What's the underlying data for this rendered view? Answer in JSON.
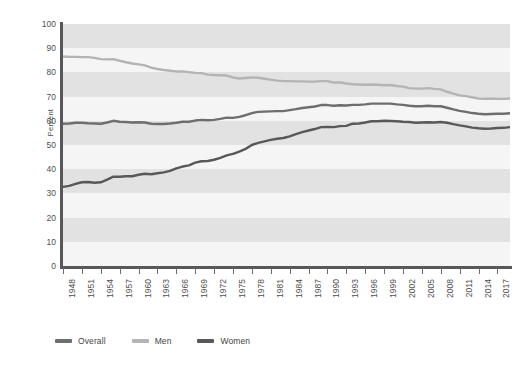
{
  "chart_data": {
    "type": "line",
    "title": "",
    "xlabel": "",
    "ylabel": "Percent",
    "ylim": [
      0,
      100
    ],
    "ytick_step": 10,
    "ytick_labels": [
      "100",
      "90",
      "80",
      "70",
      "60",
      "50",
      "40",
      "30",
      "20",
      "10",
      "0"
    ],
    "xlim": [
      1948,
      2019
    ],
    "xtick_step": 3,
    "grid": "horizontal-alternating-bands",
    "legend_position": "bottom-left",
    "x": [
      1948,
      1949,
      1950,
      1951,
      1952,
      1953,
      1954,
      1955,
      1956,
      1957,
      1958,
      1959,
      1960,
      1961,
      1962,
      1963,
      1964,
      1965,
      1966,
      1967,
      1968,
      1969,
      1970,
      1971,
      1972,
      1973,
      1974,
      1975,
      1976,
      1977,
      1978,
      1979,
      1980,
      1981,
      1982,
      1983,
      1984,
      1985,
      1986,
      1987,
      1988,
      1989,
      1990,
      1991,
      1992,
      1993,
      1994,
      1995,
      1996,
      1997,
      1998,
      1999,
      2000,
      2001,
      2002,
      2003,
      2004,
      2005,
      2006,
      2007,
      2008,
      2009,
      2010,
      2011,
      2012,
      2013,
      2014,
      2015,
      2016,
      2017,
      2018,
      2019
    ],
    "xtick_labels": [
      "1948",
      "1951",
      "1954",
      "1957",
      "1960",
      "1963",
      "1966",
      "1969",
      "1972",
      "1975",
      "1978",
      "1981",
      "1984",
      "1987",
      "1990",
      "1993",
      "1996",
      "1999",
      "2002",
      "2005",
      "2008",
      "2011",
      "2014",
      "2017"
    ],
    "series": [
      {
        "name": "Overall",
        "color": "#6d6e70",
        "values": [
          58.8,
          58.9,
          59.2,
          59.2,
          59.0,
          58.9,
          58.8,
          59.3,
          60.0,
          59.6,
          59.5,
          59.3,
          59.4,
          59.3,
          58.8,
          58.7,
          58.7,
          58.9,
          59.2,
          59.6,
          59.6,
          60.1,
          60.4,
          60.2,
          60.4,
          60.8,
          61.3,
          61.2,
          61.6,
          62.3,
          63.2,
          63.7,
          63.8,
          63.9,
          64.0,
          64.0,
          64.4,
          64.8,
          65.3,
          65.6,
          65.9,
          66.5,
          66.5,
          66.2,
          66.4,
          66.3,
          66.6,
          66.6,
          66.8,
          67.1,
          67.1,
          67.1,
          67.1,
          66.8,
          66.6,
          66.2,
          66.0,
          66.0,
          66.2,
          66.0,
          66.0,
          65.4,
          64.7,
          64.1,
          63.7,
          63.2,
          62.9,
          62.7,
          62.8,
          62.9,
          62.9,
          63.1
        ]
      },
      {
        "name": "Men",
        "color": "#b4b4b4",
        "values": [
          86.6,
          86.4,
          86.4,
          86.3,
          86.3,
          86.0,
          85.5,
          85.4,
          85.5,
          84.8,
          84.2,
          83.7,
          83.3,
          82.9,
          82.0,
          81.4,
          81.0,
          80.7,
          80.4,
          80.4,
          80.1,
          79.8,
          79.7,
          79.1,
          78.9,
          78.8,
          78.7,
          77.9,
          77.5,
          77.7,
          77.9,
          77.8,
          77.4,
          77.0,
          76.6,
          76.4,
          76.4,
          76.3,
          76.3,
          76.2,
          76.2,
          76.4,
          76.4,
          75.8,
          75.8,
          75.4,
          75.1,
          75.0,
          74.9,
          75.0,
          74.9,
          74.7,
          74.8,
          74.4,
          74.1,
          73.5,
          73.3,
          73.3,
          73.5,
          73.2,
          73.0,
          72.0,
          71.2,
          70.5,
          70.2,
          69.7,
          69.2,
          69.1,
          69.2,
          69.1,
          69.1,
          69.2
        ]
      },
      {
        "name": "Women",
        "color": "#58585a",
        "values": [
          32.7,
          33.1,
          33.9,
          34.6,
          34.7,
          34.4,
          34.6,
          35.7,
          36.9,
          36.9,
          37.1,
          37.1,
          37.7,
          38.1,
          37.9,
          38.3,
          38.7,
          39.3,
          40.3,
          41.1,
          41.6,
          42.7,
          43.3,
          43.4,
          43.9,
          44.7,
          45.7,
          46.3,
          47.3,
          48.4,
          50.0,
          50.9,
          51.5,
          52.1,
          52.6,
          52.9,
          53.6,
          54.5,
          55.3,
          56.0,
          56.6,
          57.4,
          57.5,
          57.4,
          57.8,
          57.9,
          58.8,
          58.9,
          59.3,
          59.8,
          59.8,
          60.0,
          59.9,
          59.8,
          59.6,
          59.5,
          59.2,
          59.3,
          59.4,
          59.3,
          59.5,
          59.2,
          58.6,
          58.1,
          57.7,
          57.2,
          56.9,
          56.7,
          56.8,
          57.0,
          57.1,
          57.4
        ]
      }
    ],
    "legend": [
      {
        "label": "Overall",
        "color": "#6d6e70"
      },
      {
        "label": "Men",
        "color": "#b4b4b4"
      },
      {
        "label": "Women",
        "color": "#58585a"
      }
    ],
    "band_colors": {
      "light": "#f5f5f5",
      "dark": "#e2e2e2"
    }
  }
}
